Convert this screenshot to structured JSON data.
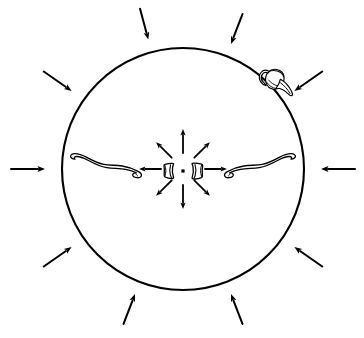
{
  "figure": {
    "background_color": "#ffffff",
    "ink_color": "#000000",
    "width": 364,
    "height": 338
  },
  "boundary_circle": {
    "label": "site boundary circle",
    "center_x": 183,
    "center_y": 169,
    "radius": 121,
    "stroke_width": 2.1,
    "stroke_color": "#000000",
    "fill": "none"
  },
  "center_marker": {
    "label": "central point marker",
    "x": 183,
    "y": 171,
    "size": 3.2,
    "color": "#000000"
  },
  "outer_arrows": {
    "label": "inward pointing arrows outside circle",
    "count": 10,
    "direction": "inward",
    "stroke_width": 2.0,
    "color": "#000000",
    "items": [
      {
        "name": "outer-arrow-n-left",
        "angle_deg": 255,
        "start_r": 166,
        "end_r": 134
      },
      {
        "name": "outer-arrow-n-right",
        "angle_deg": 291,
        "start_r": 166,
        "end_r": 134
      },
      {
        "name": "outer-arrow-ne",
        "angle_deg": 325,
        "start_r": 170,
        "end_r": 136
      },
      {
        "name": "outer-arrow-e",
        "angle_deg": 0,
        "start_r": 172,
        "end_r": 138
      },
      {
        "name": "outer-arrow-se",
        "angle_deg": 35,
        "start_r": 170,
        "end_r": 136
      },
      {
        "name": "outer-arrow-s-right",
        "angle_deg": 69,
        "start_r": 166,
        "end_r": 134
      },
      {
        "name": "outer-arrow-s-left",
        "angle_deg": 111,
        "start_r": 166,
        "end_r": 134
      },
      {
        "name": "outer-arrow-sw",
        "angle_deg": 145,
        "start_r": 170,
        "end_r": 136
      },
      {
        "name": "outer-arrow-w",
        "angle_deg": 180,
        "start_r": 172,
        "end_r": 138
      },
      {
        "name": "outer-arrow-nw",
        "angle_deg": 215,
        "start_r": 170,
        "end_r": 136
      }
    ]
  },
  "inner_arrows": {
    "label": "outward radiating arrows from centre",
    "count": 8,
    "direction": "outward",
    "stroke_width": 1.8,
    "color": "#000000",
    "items": [
      {
        "name": "inner-arrow-n",
        "angle_deg": 270,
        "start_r": 16,
        "end_r": 40
      },
      {
        "name": "inner-arrow-ne",
        "angle_deg": 315,
        "start_r": 16,
        "end_r": 38
      },
      {
        "name": "inner-arrow-e",
        "angle_deg": 0,
        "start_r": 22,
        "end_r": 44
      },
      {
        "name": "inner-arrow-se",
        "angle_deg": 45,
        "start_r": 16,
        "end_r": 38
      },
      {
        "name": "inner-arrow-s",
        "angle_deg": 90,
        "start_r": 16,
        "end_r": 40
      },
      {
        "name": "inner-arrow-sw",
        "angle_deg": 135,
        "start_r": 16,
        "end_r": 38
      },
      {
        "name": "inner-arrow-w",
        "angle_deg": 180,
        "start_r": 22,
        "end_r": 44
      },
      {
        "name": "inner-arrow-nw",
        "angle_deg": 225,
        "start_r": 16,
        "end_r": 38
      }
    ]
  },
  "artifacts": {
    "sherd_left": {
      "label": "pottery sherd fragment left of centre",
      "x": 168,
      "y": 171,
      "stroke_width": 1.3
    },
    "sherd_right": {
      "label": "pottery sherd fragment right of centre",
      "x": 198,
      "y": 171,
      "stroke_width": 1.3
    },
    "bone_left": {
      "label": "long curved bone, left side",
      "x": 72,
      "y": 158,
      "stroke_width": 1.3
    },
    "bone_right": {
      "label": "long curved bone, right side",
      "x": 228,
      "y": 158,
      "stroke_width": 1.3
    },
    "vessel": {
      "label": "handled ceramic vessel on upper right circle edge",
      "x": 262,
      "y": 68,
      "stroke_width": 1.2
    }
  }
}
